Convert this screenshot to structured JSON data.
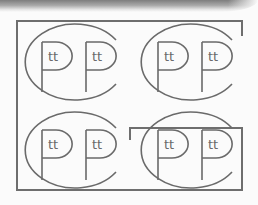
{
  "figure": {
    "stroke_color": "#6a6a6a",
    "frame_color": "#6e6e6e",
    "background": "#fbfbfb",
    "logos": [
      {
        "id": "top-left",
        "letters": [
          "P",
          "P"
        ],
        "inner_text": [
          "tt",
          "tt"
        ]
      },
      {
        "id": "top-right",
        "letters": [
          "P",
          "P"
        ],
        "inner_text": [
          "tt",
          "tt"
        ]
      },
      {
        "id": "bottom-left",
        "letters": [
          "P",
          "P"
        ],
        "inner_text": [
          "tt",
          "tt"
        ]
      },
      {
        "id": "bottom-right",
        "letters": [
          "P",
          "P"
        ],
        "inner_text": [
          "tt",
          "tt"
        ]
      }
    ]
  }
}
